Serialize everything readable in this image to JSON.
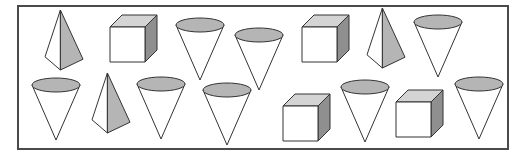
{
  "figure": {
    "colors": {
      "stroke": "#333333",
      "shade_light": "#d4d4d4",
      "shade_mid": "#b5b5b5",
      "shade_dark": "#8f8f8f",
      "fill": "#ffffff",
      "frame": "#4a4a4a"
    },
    "shapes": [
      {
        "type": "pyramid",
        "x": 45,
        "y": 10,
        "w": 28,
        "h": 60
      },
      {
        "type": "cube",
        "x": 110,
        "y": 15,
        "s": 35,
        "d": 12
      },
      {
        "type": "cone",
        "x": 176,
        "y": 18,
        "w": 48,
        "h": 62
      },
      {
        "type": "cone",
        "x": 235,
        "y": 28,
        "w": 48,
        "h": 62
      },
      {
        "type": "cube",
        "x": 302,
        "y": 15,
        "s": 35,
        "d": 12
      },
      {
        "type": "pyramid",
        "x": 367,
        "y": 8,
        "w": 28,
        "h": 60
      },
      {
        "type": "cone",
        "x": 414,
        "y": 15,
        "w": 48,
        "h": 62
      },
      {
        "type": "cone",
        "x": 32,
        "y": 78,
        "w": 48,
        "h": 62
      },
      {
        "type": "pyramid",
        "x": 92,
        "y": 73,
        "w": 28,
        "h": 60
      },
      {
        "type": "cone",
        "x": 137,
        "y": 77,
        "w": 48,
        "h": 62
      },
      {
        "type": "cone",
        "x": 203,
        "y": 83,
        "w": 48,
        "h": 62
      },
      {
        "type": "cube",
        "x": 283,
        "y": 94,
        "s": 35,
        "d": 12
      },
      {
        "type": "cone",
        "x": 341,
        "y": 80,
        "w": 48,
        "h": 62
      },
      {
        "type": "cube",
        "x": 396,
        "y": 90,
        "s": 35,
        "d": 12
      },
      {
        "type": "cone",
        "x": 455,
        "y": 77,
        "w": 48,
        "h": 62
      }
    ],
    "counts": {
      "pyramid": 3,
      "cube": 4,
      "cone": 8
    }
  }
}
